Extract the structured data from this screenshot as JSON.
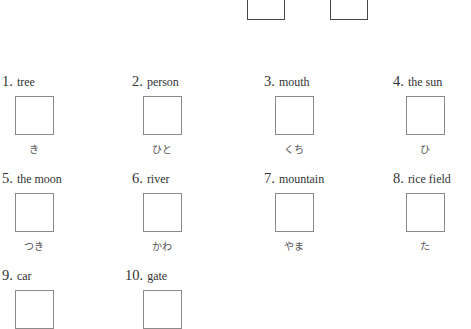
{
  "top_boxes": [
    {
      "left": 247
    },
    {
      "left": 330
    }
  ],
  "items": [
    {
      "number": "1.",
      "word": "tree",
      "reading": "き"
    },
    {
      "number": "2.",
      "word": "person",
      "reading": "ひと"
    },
    {
      "number": "3.",
      "word": "mouth",
      "reading": "くち"
    },
    {
      "number": "4.",
      "word": "the sun",
      "reading": "ひ"
    },
    {
      "number": "5.",
      "word": "the moon",
      "reading": "つき"
    },
    {
      "number": "6.",
      "word": "river",
      "reading": "かわ"
    },
    {
      "number": "7.",
      "word": "mountain",
      "reading": "やま"
    },
    {
      "number": "8.",
      "word": "rice field",
      "reading": "た"
    },
    {
      "number": "9.",
      "word": "car",
      "reading": ""
    },
    {
      "number": "10.",
      "word": "gate",
      "reading": ""
    }
  ]
}
